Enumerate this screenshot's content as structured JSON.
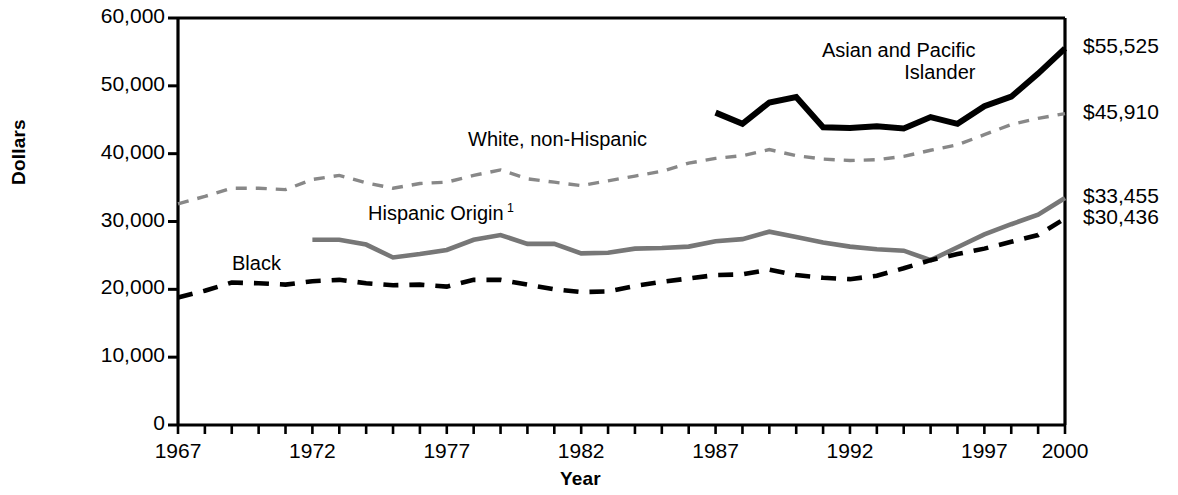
{
  "chart_data": {
    "type": "line",
    "title": "",
    "xlabel": "Year",
    "ylabel": "Dollars",
    "xlim": [
      1967,
      2000
    ],
    "ylim": [
      0,
      60000
    ],
    "grid": false,
    "legend_position": "inline-labels",
    "x": [
      1967,
      1968,
      1969,
      1970,
      1971,
      1972,
      1973,
      1974,
      1975,
      1976,
      1977,
      1978,
      1979,
      1980,
      1981,
      1982,
      1983,
      1984,
      1985,
      1986,
      1987,
      1988,
      1989,
      1990,
      1991,
      1992,
      1993,
      1994,
      1995,
      1996,
      1997,
      1998,
      1999,
      2000
    ],
    "y_ticks": [
      0,
      10000,
      20000,
      30000,
      40000,
      50000,
      60000
    ],
    "y_tick_labels": [
      "0",
      "10,000",
      "20,000",
      "30,000",
      "40,000",
      "50,000",
      "60,000"
    ],
    "x_ticks": [
      1967,
      1972,
      1977,
      1982,
      1987,
      1992,
      1997,
      2000
    ],
    "x_tick_labels": [
      "1967",
      "1972",
      "1977",
      "1982",
      "1987",
      "1992",
      "1997",
      "2000"
    ],
    "series": [
      {
        "name": "Asian and Pacific Islander",
        "label_text_line1": "Asian and Pacific",
        "label_text_line2": "Islander",
        "color": "#000000",
        "style": "solid-thick",
        "end_value_label": "$55,525",
        "start_year": 1987,
        "x": [
          1987,
          1988,
          1989,
          1990,
          1991,
          1992,
          1993,
          1994,
          1995,
          1996,
          1997,
          1998,
          1999,
          2000
        ],
        "values": [
          46050,
          44400,
          47550,
          48350,
          43900,
          43800,
          44050,
          43700,
          45400,
          44400,
          47000,
          48400,
          51800,
          55525
        ]
      },
      {
        "name": "White, non-Hispanic",
        "label_text_line1": "White, non-Hispanic",
        "color": "#888888",
        "style": "dashed-medium",
        "end_value_label": "$45,910",
        "start_year": 1967,
        "x": [
          1967,
          1968,
          1969,
          1970,
          1971,
          1972,
          1973,
          1974,
          1975,
          1976,
          1977,
          1978,
          1979,
          1980,
          1981,
          1982,
          1983,
          1984,
          1985,
          1986,
          1987,
          1988,
          1989,
          1990,
          1991,
          1992,
          1993,
          1994,
          1995,
          1996,
          1997,
          1998,
          1999,
          2000
        ],
        "values": [
          32600,
          33700,
          34900,
          34900,
          34700,
          36200,
          36800,
          35700,
          34900,
          35600,
          35800,
          36800,
          37600,
          36300,
          35800,
          35300,
          36000,
          36700,
          37400,
          38600,
          39300,
          39700,
          40600,
          39700,
          39200,
          39000,
          39100,
          39600,
          40500,
          41300,
          42800,
          44300,
          45200,
          45910
        ]
      },
      {
        "name": "Hispanic Origin",
        "label_text_line1": "Hispanic Origin",
        "label_footnote": "1",
        "color": "#777777",
        "style": "solid-medium",
        "end_value_label": "$33,455",
        "start_year": 1972,
        "x": [
          1972,
          1973,
          1974,
          1975,
          1976,
          1977,
          1978,
          1979,
          1980,
          1981,
          1982,
          1983,
          1984,
          1985,
          1986,
          1987,
          1988,
          1989,
          1990,
          1991,
          1992,
          1993,
          1994,
          1995,
          1996,
          1997,
          1998,
          1999,
          2000
        ],
        "values": [
          27300,
          27300,
          26600,
          24700,
          25200,
          25800,
          27300,
          28000,
          26700,
          26700,
          25300,
          25400,
          26000,
          26100,
          26300,
          27100,
          27400,
          28500,
          27700,
          26900,
          26300,
          25900,
          25700,
          24300,
          26200,
          28100,
          29600,
          31000,
          33455
        ]
      },
      {
        "name": "Black",
        "label_text_line1": "Black",
        "color": "#000000",
        "style": "dashed-thick",
        "end_value_label": "$30,436",
        "start_year": 1967,
        "x": [
          1967,
          1968,
          1969,
          1970,
          1971,
          1972,
          1973,
          1974,
          1975,
          1976,
          1977,
          1978,
          1979,
          1980,
          1981,
          1982,
          1983,
          1984,
          1985,
          1986,
          1987,
          1988,
          1989,
          1990,
          1991,
          1992,
          1993,
          1994,
          1995,
          1996,
          1997,
          1998,
          1999,
          2000
        ],
        "values": [
          18800,
          19800,
          21000,
          20900,
          20700,
          21200,
          21400,
          20900,
          20600,
          20700,
          20400,
          21400,
          21400,
          20700,
          20000,
          19600,
          19700,
          20500,
          21100,
          21600,
          22100,
          22200,
          22900,
          22100,
          21700,
          21500,
          22000,
          23100,
          24300,
          25200,
          26000,
          27000,
          28000,
          30436
        ]
      }
    ],
    "end_value_labels": [
      "$55,525",
      "$45,910",
      "$33,455",
      "$30,436"
    ]
  },
  "axis": {
    "y_title": "Dollars",
    "x_title": "Year"
  }
}
